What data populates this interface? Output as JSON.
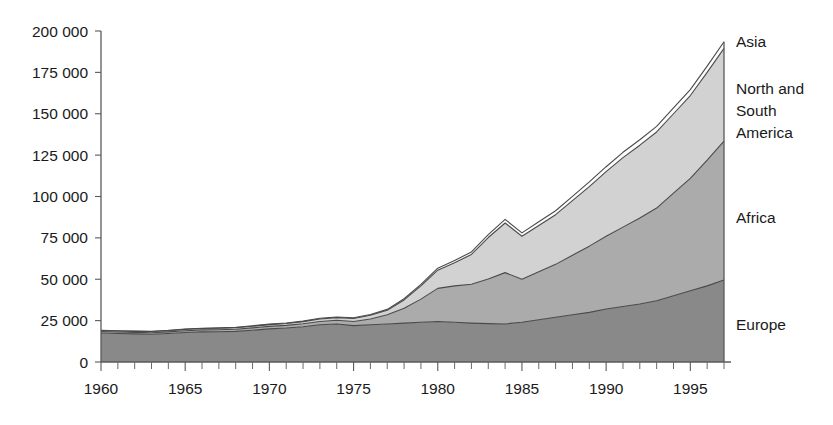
{
  "chart_data": {
    "type": "area",
    "stacked": true,
    "title": "",
    "subtitle": "",
    "xlabel": "",
    "ylabel": "",
    "grid": false,
    "legend_position": "right-inline",
    "xlim": [
      1960,
      1997
    ],
    "ylim": [
      0,
      200000
    ],
    "x": [
      1960,
      1961,
      1962,
      1963,
      1964,
      1965,
      1966,
      1967,
      1968,
      1969,
      1970,
      1971,
      1972,
      1973,
      1974,
      1975,
      1976,
      1977,
      1978,
      1979,
      1980,
      1981,
      1982,
      1983,
      1984,
      1985,
      1986,
      1987,
      1988,
      1989,
      1990,
      1991,
      1992,
      1993,
      1994,
      1995,
      1996,
      1997
    ],
    "x_tick_labels": [
      "1960",
      "1965",
      "1970",
      "1975",
      "1980",
      "1985",
      "1990",
      "1995"
    ],
    "x_tick_values": [
      1960,
      1965,
      1970,
      1975,
      1980,
      1985,
      1990,
      1995
    ],
    "x_minor_tick_step": 1,
    "y_tick_labels": [
      "0",
      "25 000",
      "50 000",
      "75 000",
      "100 000",
      "125 000",
      "150 000",
      "175 000",
      "200 000"
    ],
    "y_tick_values": [
      0,
      25000,
      50000,
      75000,
      100000,
      125000,
      150000,
      175000,
      200000
    ],
    "series": [
      {
        "name": "Europe",
        "label": "Europe",
        "color": "#898989",
        "order": 1,
        "values": [
          17500,
          17200,
          17000,
          16800,
          17200,
          17800,
          18200,
          18300,
          18500,
          19200,
          20000,
          20500,
          21300,
          22500,
          23000,
          22000,
          22500,
          23000,
          23500,
          24000,
          24500,
          24000,
          23500,
          23200,
          23000,
          24000,
          25500,
          27000,
          28500,
          30000,
          32000,
          33500,
          35000,
          37000,
          40000,
          43000,
          46000,
          49500
        ]
      },
      {
        "name": "Africa",
        "label": "Africa",
        "color": "#ababab",
        "order": 2,
        "values": [
          900,
          900,
          900,
          900,
          1000,
          1100,
          1200,
          1200,
          1300,
          1400,
          1500,
          1600,
          1800,
          2000,
          2200,
          2500,
          3500,
          5500,
          9000,
          14000,
          20000,
          22000,
          23500,
          27000,
          31000,
          26000,
          29000,
          32000,
          36000,
          40000,
          44000,
          48000,
          52000,
          56000,
          62000,
          68000,
          76000,
          84000
        ]
      },
      {
        "name": "North and South America",
        "label": "North and\nSouth\nAmerica",
        "label_lines": [
          "North and",
          "South",
          "America"
        ],
        "color": "#d2d2d2",
        "order": 3,
        "values": [
          600,
          600,
          600,
          700,
          700,
          800,
          800,
          900,
          900,
          1000,
          1100,
          1200,
          1300,
          1500,
          1600,
          1800,
          2200,
          2800,
          5000,
          8000,
          11000,
          14000,
          18000,
          25000,
          30000,
          26000,
          28000,
          30000,
          33000,
          36000,
          39000,
          42000,
          44000,
          46000,
          48000,
          50000,
          53000,
          56000
        ]
      },
      {
        "name": "Asia",
        "label": "Asia",
        "color": "#fdfdfd",
        "order": 4,
        "values": [
          200,
          200,
          200,
          200,
          200,
          200,
          200,
          200,
          200,
          300,
          300,
          300,
          300,
          400,
          400,
          400,
          500,
          500,
          700,
          900,
          1200,
          1300,
          1500,
          1800,
          2200,
          2000,
          2200,
          2400,
          2600,
          2800,
          3000,
          3200,
          3300,
          3400,
          3500,
          3600,
          3800,
          4000
        ]
      }
    ],
    "totals": [
      19200,
      18900,
      18700,
      18600,
      19100,
      19900,
      20400,
      20600,
      20900,
      21900,
      22900,
      23600,
      24700,
      26400,
      27200,
      26700,
      28700,
      31800,
      38200,
      46900,
      56700,
      61300,
      66500,
      77000,
      86200,
      78000,
      84700,
      91400,
      100100,
      108800,
      118000,
      126700,
      134300,
      142400,
      153500,
      164600,
      178800,
      193500
    ]
  },
  "geometry": {
    "plot_left": 101,
    "plot_right": 724,
    "plot_top": 31,
    "plot_bottom": 362
  }
}
